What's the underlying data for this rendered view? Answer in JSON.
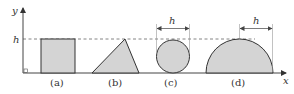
{
  "diagram": {
    "axes": {
      "x_label": "x",
      "y_label": "y",
      "h_tick_label": "h"
    },
    "shapes": [
      {
        "id": "a",
        "shape": "square",
        "label": "(a)"
      },
      {
        "id": "b",
        "shape": "triangle",
        "label": "(b)"
      },
      {
        "id": "c",
        "shape": "circle",
        "label": "(c)",
        "dimension_label": "h"
      },
      {
        "id": "d",
        "shape": "semicircle",
        "label": "(d)",
        "dimension_label": "h"
      }
    ],
    "colors": {
      "fill": "#d4d4d4",
      "stroke": "#333333",
      "dashed": "#666666",
      "dimension": "#888888"
    }
  }
}
